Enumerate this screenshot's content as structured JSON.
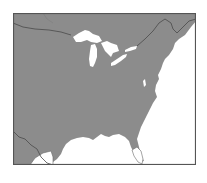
{
  "map": {
    "title": "",
    "region": "Eastern United States",
    "colors": {
      "land": "#8c8c8c",
      "water": "#ffffff",
      "border_line": "#4a4a4a",
      "frame": "#555555"
    },
    "features": [
      "great-lakes",
      "atlantic-coast",
      "gulf-coast",
      "florida-peninsula",
      "canada-border"
    ]
  }
}
